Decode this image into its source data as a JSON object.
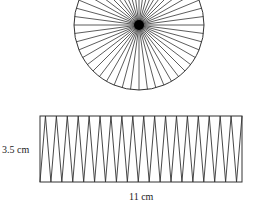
{
  "diagram": {
    "type": "circle-area-rearrangement",
    "circle": {
      "cx": 139,
      "cy": 25,
      "r": 65,
      "spoke_count": 48,
      "center_dot_r": 5,
      "stroke": "#333333"
    },
    "rectangle": {
      "x": 40,
      "y": 116,
      "width": 202,
      "height": 66,
      "top_apex_count": 18,
      "stroke": "#333333"
    },
    "labels": {
      "height": "3.5 cm",
      "width": "11 cm"
    }
  }
}
